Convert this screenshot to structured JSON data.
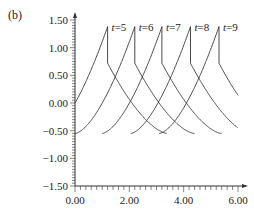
{
  "panel_label": "(b)",
  "chart_data": {
    "type": "line",
    "title": "",
    "xlabel": "",
    "ylabel": "",
    "xlim": [
      0,
      6
    ],
    "ylim": [
      -1.5,
      1.5
    ],
    "x_ticks": [
      "0.00",
      "2.00",
      "4.00",
      "6.00"
    ],
    "y_ticks": [
      "1.50",
      "1.00",
      "0.50",
      "0.00",
      "-0.50",
      "-1.00",
      "-1.50"
    ],
    "grid": false,
    "legend": "inline labels at curve peaks",
    "series": [
      {
        "name": "t=5",
        "label": "t=5",
        "peak_x": 1.2
      },
      {
        "name": "t=6",
        "label": "t=6",
        "peak_x": 2.2
      },
      {
        "name": "t=7",
        "label": "t=7",
        "peak_x": 3.2
      },
      {
        "name": "t=8",
        "label": "t=8",
        "peak_x": 4.25
      },
      {
        "name": "t=9",
        "label": "t=9",
        "peak_x": 5.3
      }
    ],
    "curve_shape": {
      "min_value": -0.55,
      "peak_value": 1.38,
      "post_drop_value": 0.72,
      "period": 1.2
    }
  }
}
